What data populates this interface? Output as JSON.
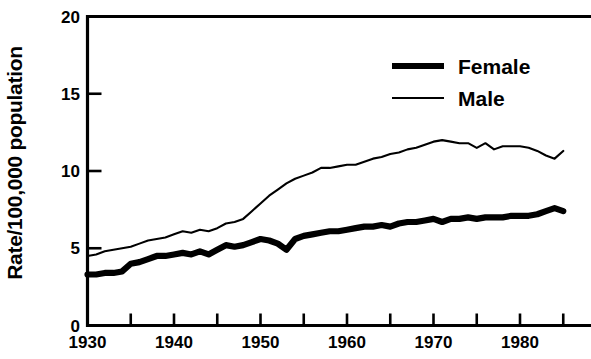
{
  "chart_data": {
    "type": "line",
    "title": "",
    "xlabel": "",
    "ylabel": "Rate/100,000 population",
    "xlim": [
      1930,
      1985
    ],
    "ylim": [
      0,
      20
    ],
    "xticks": [
      1930,
      1935,
      1940,
      1945,
      1950,
      1955,
      1960,
      1965,
      1970,
      1975,
      1980,
      1985
    ],
    "xtick_labels": [
      "1930",
      "",
      "1940",
      "",
      "1950",
      "",
      "1960",
      "",
      "1970",
      "",
      "1980",
      ""
    ],
    "yticks": [
      0,
      5,
      10,
      15,
      20
    ],
    "ytick_labels": [
      "0",
      "5",
      "10",
      "15",
      "20"
    ],
    "grid": false,
    "legend_position": "top-right",
    "legend": [
      "Female",
      "Male"
    ],
    "x": [
      1930,
      1931,
      1932,
      1933,
      1934,
      1935,
      1936,
      1937,
      1938,
      1939,
      1940,
      1941,
      1942,
      1943,
      1944,
      1945,
      1946,
      1947,
      1948,
      1949,
      1950,
      1951,
      1952,
      1953,
      1954,
      1955,
      1956,
      1957,
      1958,
      1959,
      1960,
      1961,
      1962,
      1963,
      1964,
      1965,
      1966,
      1967,
      1968,
      1969,
      1970,
      1971,
      1972,
      1973,
      1974,
      1975,
      1976,
      1977,
      1978,
      1979,
      1980,
      1981,
      1982,
      1983,
      1984,
      1985
    ],
    "series": [
      {
        "name": "Female",
        "line_style": "thick",
        "color": "#000000",
        "values": [
          3.3,
          3.3,
          3.4,
          3.4,
          3.5,
          4.0,
          4.1,
          4.3,
          4.5,
          4.5,
          4.6,
          4.7,
          4.6,
          4.8,
          4.6,
          4.9,
          5.2,
          5.1,
          5.2,
          5.4,
          5.6,
          5.5,
          5.3,
          4.9,
          5.6,
          5.8,
          5.9,
          6.0,
          6.1,
          6.1,
          6.2,
          6.3,
          6.4,
          6.4,
          6.5,
          6.4,
          6.6,
          6.7,
          6.7,
          6.8,
          6.9,
          6.7,
          6.9,
          6.9,
          7.0,
          6.9,
          7.0,
          7.0,
          7.0,
          7.1,
          7.1,
          7.1,
          7.2,
          7.4,
          7.6,
          7.4
        ]
      },
      {
        "name": "Male",
        "line_style": "thin",
        "color": "#000000",
        "values": [
          4.5,
          4.6,
          4.8,
          4.9,
          5.0,
          5.1,
          5.3,
          5.5,
          5.6,
          5.7,
          5.9,
          6.1,
          6.0,
          6.2,
          6.1,
          6.3,
          6.6,
          6.7,
          6.9,
          7.4,
          7.9,
          8.4,
          8.8,
          9.2,
          9.5,
          9.7,
          9.9,
          10.2,
          10.2,
          10.3,
          10.4,
          10.4,
          10.6,
          10.8,
          10.9,
          11.1,
          11.2,
          11.4,
          11.5,
          11.7,
          11.9,
          12.0,
          11.9,
          11.8,
          11.8,
          11.5,
          11.8,
          11.4,
          11.6,
          11.6,
          11.6,
          11.5,
          11.3,
          11.0,
          10.8,
          11.3
        ]
      }
    ]
  },
  "axis_label": {
    "y": "Rate/100,000 population"
  },
  "legend": {
    "items": [
      {
        "label": "Female",
        "style": "thick"
      },
      {
        "label": "Male",
        "style": "thin"
      }
    ]
  }
}
